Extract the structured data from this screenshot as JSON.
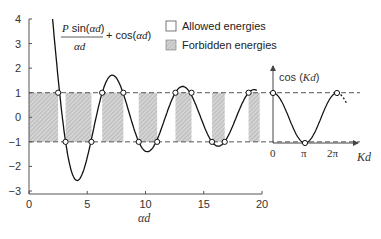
{
  "chart_data": {
    "type": "line",
    "title": "",
    "formula": {
      "numerator_prefix": "P",
      "numerator_func": " sin(",
      "numerator_arg": "αd",
      "numerator_close": ")",
      "denominator": "αd",
      "suffix_plus": "+ cos(",
      "suffix_arg": "αd",
      "suffix_close": ")"
    },
    "xlabel": "αd",
    "ylabel": "",
    "xlim": [
      0,
      20
    ],
    "ylim": [
      -3,
      4
    ],
    "xticks": [
      0,
      5,
      10,
      15,
      20
    ],
    "yticks": [
      -3,
      -2,
      -1,
      0,
      1,
      2,
      3,
      4
    ],
    "parameter_P": 10,
    "series": [
      {
        "name": "P sin(αd)/αd + cos(αd)",
        "function": "P*sin(x)/x + cos(x)",
        "x": [
          2.0,
          2.5,
          3.0,
          3.5,
          4.0,
          4.3,
          4.5,
          5.0,
          5.5,
          6.0,
          6.5,
          7.0,
          7.5,
          8.0,
          8.5,
          9.0,
          9.5,
          10.0,
          10.5,
          11.0,
          11.5,
          12.0,
          12.5,
          13.0,
          13.5,
          14.0,
          14.5,
          15.0,
          15.5,
          16.0,
          16.5,
          17.0,
          17.5,
          18.0,
          18.5,
          19.0,
          19.5
        ],
        "values": [
          4.13,
          1.59,
          -0.52,
          -1.93,
          -2.55,
          -2.61,
          -2.37,
          -1.63,
          -0.61,
          0.49,
          1.3,
          1.69,
          1.55,
          1.09,
          0.39,
          -0.45,
          -1.07,
          -1.38,
          -1.33,
          -0.91,
          -0.34,
          0.4,
          0.99,
          1.24,
          1.25,
          0.77,
          0.36,
          -0.26,
          -0.85,
          -1.14,
          -1.17,
          -0.94,
          -0.51,
          -0.09,
          0.64,
          1.0,
          1.0
        ]
      }
    ],
    "reference_lines": [
      {
        "y": 1,
        "style": "dashed"
      },
      {
        "y": -1,
        "style": "dashed"
      }
    ],
    "bands": [
      {
        "type": "forbidden",
        "x0": 0.0,
        "x1": 2.5
      },
      {
        "type": "allowed",
        "x0": 2.5,
        "x1": 3.14
      },
      {
        "type": "forbidden",
        "x0": 3.14,
        "x1": 5.36
      },
      {
        "type": "allowed",
        "x0": 5.36,
        "x1": 6.28
      },
      {
        "type": "forbidden",
        "x0": 6.28,
        "x1": 8.1
      },
      {
        "type": "allowed",
        "x0": 8.1,
        "x1": 9.42
      },
      {
        "type": "forbidden",
        "x0": 9.42,
        "x1": 11.0
      },
      {
        "type": "allowed",
        "x0": 11.0,
        "x1": 12.57
      },
      {
        "type": "forbidden",
        "x0": 12.57,
        "x1": 13.95
      },
      {
        "type": "allowed",
        "x0": 13.95,
        "x1": 15.71
      },
      {
        "type": "forbidden",
        "x0": 15.71,
        "x1": 16.8
      },
      {
        "type": "allowed",
        "x0": 16.8,
        "x1": 18.85
      },
      {
        "type": "forbidden",
        "x0": 18.85,
        "x1": 19.8
      }
    ],
    "legend": [
      {
        "label": "Allowed energies",
        "swatch": "white"
      },
      {
        "label": "Forbidden energies",
        "swatch": "hatched-gray"
      }
    ],
    "legend_position": "upper right",
    "grid": false,
    "inset": {
      "type": "line",
      "ylabel_prefix": "cos (",
      "ylabel_arg": "Kd",
      "ylabel_close": ")",
      "xlabel": "Kd",
      "xticks": [
        "0",
        "π",
        "2π"
      ],
      "function": "cos(Kd)",
      "x": [
        0,
        1.57,
        3.14,
        4.71,
        6.28
      ],
      "values": [
        1,
        0,
        -1,
        0,
        1
      ]
    }
  },
  "colors": {
    "curve": "#111111",
    "axis": "#555555",
    "band_fill": "#c8c8c8",
    "dash": "#444444",
    "background": "#ffffff"
  }
}
